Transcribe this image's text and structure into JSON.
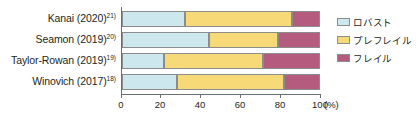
{
  "chart_data": {
    "type": "bar",
    "orientation": "horizontal",
    "stacked": true,
    "title": "",
    "xlabel": "(%)",
    "ylabel": "",
    "xlim": [
      0,
      100
    ],
    "xticks": [
      0,
      20,
      40,
      60,
      80,
      100
    ],
    "xtick_labels": [
      "0",
      "20",
      "40",
      "60",
      "80",
      "100"
    ],
    "unit_label": "(%)",
    "grid": false,
    "legend_position": "right",
    "categories": [
      "Kanai (2020)",
      "Seamon (2019)",
      "Taylor-Rowan (2019)",
      "Winovich (2017)"
    ],
    "category_refs": [
      "21)",
      "20)",
      "19)",
      "18)"
    ],
    "series": [
      {
        "name": "ロバスト",
        "color": "#cde7ef",
        "values": [
          32,
          44,
          21,
          28
        ]
      },
      {
        "name": "プレフレイル",
        "color": "#f8d978",
        "values": [
          54,
          35,
          50,
          54
        ]
      },
      {
        "name": "フレイル",
        "color": "#b45b7e",
        "values": [
          14,
          21,
          29,
          18
        ]
      }
    ],
    "cumulative_boundaries": [
      [
        32,
        86,
        100
      ],
      [
        44,
        79,
        100
      ],
      [
        21,
        71,
        100
      ],
      [
        28,
        82,
        100
      ]
    ]
  },
  "axis": {
    "tick0": "0",
    "tick1": "20",
    "tick2": "40",
    "tick3": "60",
    "tick4": "80",
    "tick5": "100",
    "unit": "(%)"
  },
  "labels": {
    "row0": "Kanai (2020)",
    "row0_ref": "21)",
    "row1": "Seamon (2019)",
    "row1_ref": "20)",
    "row2": "Taylor-Rowan (2019)",
    "row2_ref": "19)",
    "row3": "Winovich (2017)",
    "row3_ref": "18)"
  },
  "legend": {
    "item0": "ロバスト",
    "item1": "プレフレイル",
    "item2": "フレイル"
  },
  "colors": {
    "robust": "#cde7ef",
    "prefrail": "#f8d978",
    "frail": "#b45b7e",
    "axis": "#6d6e71",
    "outline": "#8c8c8c",
    "text": "#231f20"
  }
}
